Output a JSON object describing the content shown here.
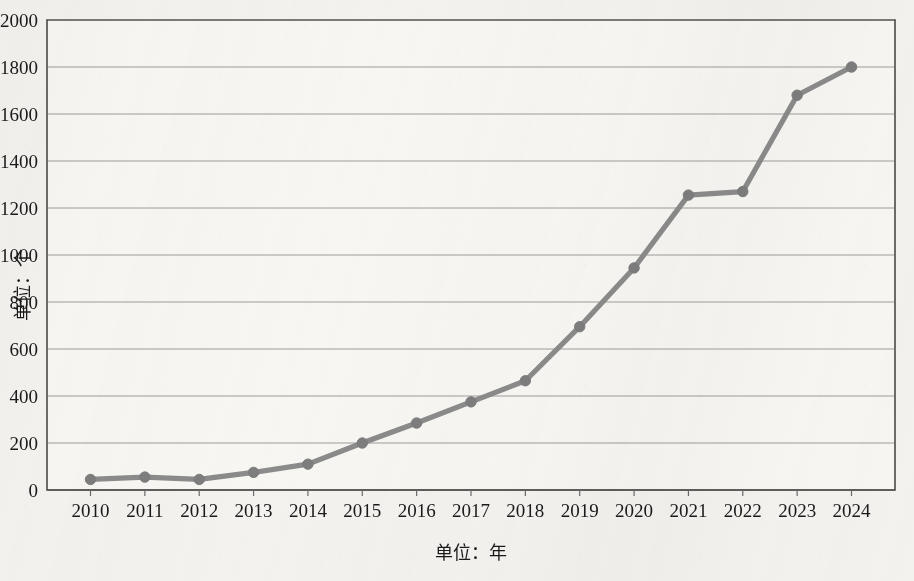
{
  "figure": {
    "background_color": "#f3f2ef",
    "plot_area_background": "#f7f6f3",
    "frame_color": "#4a4a48",
    "gridline_color": "#8e8e8a",
    "series_color": "#8b8b8b",
    "marker_color": "#7d7d7d"
  },
  "chart_data": {
    "type": "line",
    "title": "",
    "xlabel": "单位：年",
    "ylabel": "单位：个",
    "x": [
      2010,
      2011,
      2012,
      2013,
      2014,
      2015,
      2016,
      2017,
      2018,
      2019,
      2020,
      2021,
      2022,
      2023,
      2024
    ],
    "xtick_labels": [
      "2010",
      "2011",
      "2012",
      "2013",
      "2014",
      "2015",
      "2016",
      "2017",
      "2018",
      "2019",
      "2020",
      "2021",
      "2022",
      "2023",
      "2024"
    ],
    "ytick_labels": [
      "0",
      "200",
      "400",
      "600",
      "800",
      "1000",
      "1200",
      "1400",
      "1600",
      "1800",
      "2000"
    ],
    "ytick_values": [
      0,
      200,
      400,
      600,
      800,
      1000,
      1200,
      1400,
      1600,
      1800,
      2000
    ],
    "ylim": [
      0,
      2000
    ],
    "xlim": [
      2010,
      2024
    ],
    "grid": "horizontal",
    "legend": "none",
    "marker": "circle",
    "series": [
      {
        "name": "数量",
        "values": [
          45,
          55,
          45,
          75,
          110,
          200,
          285,
          375,
          465,
          695,
          945,
          1255,
          1270,
          1680,
          1800
        ]
      }
    ]
  }
}
